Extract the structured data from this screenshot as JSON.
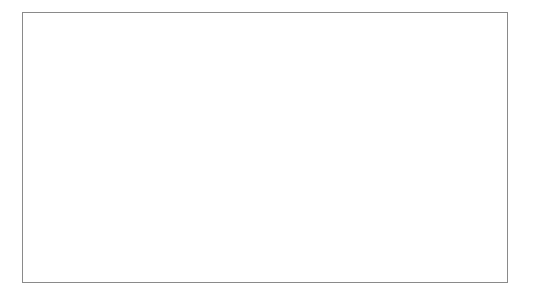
{
  "figure": {
    "background_color": "#ffffff",
    "frame_color": "#8a8a8a"
  },
  "chart_data": {
    "type": "scatter",
    "title": "",
    "xlabel": "Work rate (W)",
    "ylabel": "Oxygen consumption (mL/kg/min)",
    "xlim": [
      0,
      600
    ],
    "ylim": [
      0,
      100
    ],
    "xticks": [
      0,
      100,
      200,
      300,
      400,
      500,
      600
    ],
    "yticks": [
      0,
      10,
      20,
      30,
      40,
      50,
      60,
      70,
      80,
      90,
      100
    ],
    "xtick_labels": [
      "0",
      "100",
      "200",
      "300",
      "400",
      "500",
      "600"
    ],
    "ytick_labels": [
      "0",
      "10",
      "20",
      "30",
      "40",
      "50",
      "60",
      "70",
      "80",
      "90",
      "100"
    ],
    "grid": false,
    "legend": false,
    "legend_position": "none",
    "series": [
      {
        "name": "Oxygen consumption",
        "marker": "filled-circle",
        "marker_color": "#0d0d0d",
        "x": [
          37,
          75,
          112,
          147,
          181,
          219,
          256,
          292
        ],
        "y": [
          10.5,
          15.5,
          19.0,
          25.5,
          31.0,
          34.0,
          39.5,
          45.0
        ]
      }
    ],
    "trend_line": {
      "name": "linear regression",
      "color": "#111111",
      "x_start": 37,
      "y_start": 9.5,
      "x_end": 600,
      "y_end": 90.0
    }
  }
}
